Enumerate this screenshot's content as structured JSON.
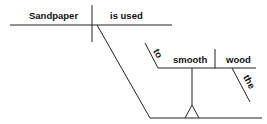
{
  "diagram": {
    "type": "sentence-diagram",
    "words": {
      "subject": "Sandpaper",
      "verb": "is used",
      "infinitive_marker": "to",
      "infinitive_verb": "smooth",
      "object": "wood",
      "article": "the"
    }
  }
}
